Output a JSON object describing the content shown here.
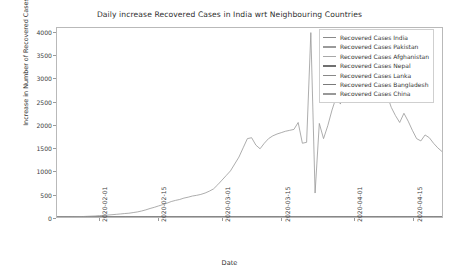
{
  "chart_data": {
    "type": "line",
    "title": "Daily increase Recovered Cases in India wrt Neighbouring Countries",
    "xlabel": "Date",
    "ylabel": "Increase in Number of Recovered Cases",
    "grid": false,
    "legend_position": "upper right",
    "ylim": [
      0,
      4100
    ],
    "yticks": [
      0,
      500,
      1000,
      1500,
      2000,
      2500,
      3000,
      3500,
      4000
    ],
    "ytick_labels": [
      "0",
      "500",
      "1000",
      "1500",
      "2000",
      "2500",
      "3000",
      "3500",
      "4000"
    ],
    "xlim": [
      "2020-01-22",
      "2020-04-22"
    ],
    "xticks": [
      "2020-02-01",
      "2020-02-15",
      "2020-03-01",
      "2020-03-15",
      "2020-04-01",
      "2020-04-15"
    ],
    "xtick_labels": [
      "2020-02-01",
      "2020-02-15",
      "2020-03-01",
      "2020-03-15",
      "2020-04-01",
      "2020-04-15"
    ],
    "colors": {
      "india": "#8a8a8a",
      "pakistan": "#9a9a9a",
      "afghanistan": "#a8a8a8",
      "nepal": "#707070",
      "lanka": "#888888",
      "bangladesh": "#7a7a7a",
      "china": "#989898"
    },
    "series": [
      {
        "name": "Recovered Cases India",
        "color": "#8a8a8a",
        "values": [
          0,
          0,
          0,
          0,
          0,
          0,
          0,
          0,
          0,
          0,
          0,
          0,
          0,
          0,
          0,
          0,
          0,
          0,
          0,
          0,
          0,
          0,
          0,
          0,
          0,
          0,
          0,
          0,
          0,
          0,
          0,
          0,
          0,
          0,
          0,
          0,
          0,
          0,
          0,
          0,
          0,
          0,
          0,
          0,
          0,
          0,
          0,
          0,
          0,
          0,
          0,
          0,
          0,
          0,
          0,
          0,
          0,
          0,
          0,
          0,
          0,
          0,
          0,
          0,
          0,
          0,
          0,
          0,
          0,
          0,
          0,
          0,
          0,
          0,
          0,
          0,
          0,
          0,
          0,
          0,
          0,
          0,
          0,
          0,
          0,
          0,
          0,
          0,
          0,
          0,
          0
        ]
      },
      {
        "name": "Recovered Cases Pakistan",
        "color": "#9a9a9a",
        "values": [
          0,
          0,
          0,
          0,
          0,
          0,
          0,
          0,
          0,
          0,
          0,
          0,
          0,
          0,
          0,
          0,
          0,
          0,
          0,
          0,
          0,
          0,
          0,
          0,
          0,
          0,
          0,
          0,
          0,
          0,
          0,
          0,
          0,
          0,
          0,
          0,
          0,
          0,
          0,
          0,
          0,
          0,
          0,
          0,
          0,
          0,
          0,
          0,
          0,
          0,
          0,
          0,
          0,
          0,
          0,
          0,
          0,
          0,
          0,
          0,
          0,
          0,
          0,
          0,
          0,
          0,
          0,
          0,
          0,
          0,
          0,
          0,
          0,
          0,
          0,
          0,
          0,
          0,
          0,
          0,
          0,
          0,
          0,
          0,
          0,
          0,
          0,
          0,
          0,
          0,
          0
        ]
      },
      {
        "name": "Recovered Cases Afghanistan",
        "color": "#a8a8a8",
        "values": [
          0,
          0,
          0,
          0,
          0,
          0,
          0,
          0,
          0,
          0,
          0,
          0,
          0,
          0,
          0,
          0,
          0,
          0,
          0,
          0,
          0,
          0,
          0,
          0,
          0,
          0,
          0,
          0,
          0,
          0,
          0,
          0,
          0,
          0,
          0,
          0,
          0,
          0,
          0,
          0,
          0,
          0,
          0,
          0,
          0,
          0,
          0,
          0,
          0,
          0,
          0,
          0,
          0,
          0,
          0,
          0,
          0,
          0,
          0,
          0,
          0,
          0,
          0,
          0,
          0,
          0,
          0,
          0,
          0,
          0,
          0,
          0,
          0,
          0,
          0,
          0,
          0,
          0,
          0,
          0,
          0,
          0,
          0,
          0,
          0,
          0,
          0,
          0,
          0,
          0,
          0
        ]
      },
      {
        "name": "Recovered Cases Nepal",
        "color": "#707070",
        "values": [
          0,
          0,
          0,
          0,
          0,
          0,
          0,
          0,
          0,
          0,
          0,
          0,
          0,
          0,
          0,
          0,
          0,
          0,
          0,
          0,
          0,
          0,
          0,
          0,
          0,
          0,
          0,
          0,
          0,
          0,
          0,
          0,
          0,
          0,
          0,
          0,
          0,
          0,
          0,
          0,
          0,
          0,
          0,
          0,
          0,
          0,
          0,
          0,
          0,
          0,
          0,
          0,
          0,
          0,
          0,
          0,
          0,
          0,
          0,
          0,
          0,
          0,
          0,
          0,
          0,
          0,
          0,
          0,
          0,
          0,
          0,
          0,
          0,
          0,
          0,
          0,
          0,
          0,
          0,
          0,
          0,
          0,
          0,
          0,
          0,
          0,
          0,
          0,
          0,
          0,
          0
        ]
      },
      {
        "name": "Recovered Cases Lanka",
        "color": "#888888",
        "values": [
          0,
          0,
          0,
          0,
          0,
          0,
          0,
          0,
          0,
          0,
          0,
          0,
          0,
          0,
          0,
          0,
          0,
          0,
          0,
          0,
          0,
          0,
          0,
          0,
          0,
          0,
          0,
          0,
          0,
          0,
          0,
          0,
          0,
          0,
          0,
          0,
          0,
          0,
          0,
          0,
          0,
          0,
          0,
          0,
          0,
          0,
          0,
          0,
          0,
          0,
          0,
          0,
          0,
          0,
          0,
          0,
          0,
          0,
          0,
          0,
          0,
          0,
          0,
          0,
          0,
          0,
          0,
          0,
          0,
          0,
          0,
          0,
          0,
          0,
          0,
          0,
          0,
          0,
          0,
          0,
          0,
          0,
          0,
          0,
          0,
          0,
          0,
          0,
          0,
          0,
          0
        ]
      },
      {
        "name": "Recovered Cases Bangladesh",
        "color": "#7a7a7a",
        "values": [
          0,
          0,
          0,
          0,
          0,
          0,
          0,
          0,
          0,
          0,
          0,
          0,
          0,
          0,
          0,
          0,
          0,
          0,
          0,
          0,
          0,
          0,
          0,
          0,
          0,
          0,
          0,
          0,
          0,
          0,
          0,
          0,
          0,
          0,
          0,
          0,
          0,
          0,
          0,
          0,
          0,
          0,
          0,
          0,
          0,
          0,
          0,
          0,
          0,
          0,
          0,
          0,
          0,
          0,
          0,
          0,
          0,
          0,
          0,
          0,
          0,
          0,
          0,
          0,
          0,
          0,
          0,
          0,
          0,
          0,
          0,
          0,
          0,
          0,
          0,
          0,
          0,
          0,
          0,
          0,
          0,
          0,
          0,
          0,
          0,
          0,
          0,
          0,
          0,
          0,
          0
        ]
      },
      {
        "name": "Recovered Cases China",
        "color": "#989898",
        "values": [
          0,
          0,
          0,
          3,
          5,
          8,
          10,
          14,
          18,
          22,
          30,
          36,
          42,
          50,
          58,
          66,
          75,
          82,
          96,
          110,
          130,
          155,
          185,
          210,
          240,
          268,
          300,
          335,
          360,
          380,
          410,
          430,
          455,
          470,
          490,
          520,
          560,
          610,
          700,
          800,
          900,
          1000,
          1150,
          1300,
          1500,
          1700,
          1720,
          1560,
          1480,
          1600,
          1700,
          1760,
          1800,
          1830,
          1860,
          1880,
          1900,
          2050,
          1600,
          1620,
          4000,
          520,
          2030,
          1700,
          1980,
          2320,
          2600,
          2450,
          3150,
          2900,
          3350,
          3480,
          3380,
          3280,
          3180,
          2950,
          2880,
          2800,
          2650,
          2380,
          2200,
          2050,
          2250,
          2080,
          1880,
          1700,
          1650,
          1780,
          1720,
          1600,
          1500,
          1420
        ]
      }
    ]
  },
  "axes": {
    "ylabel": "Increase in Number of Recovered Cases",
    "xlabel": "Date"
  },
  "legend": {
    "items": [
      {
        "label": "Recovered Cases India",
        "color": "#8a8a8a"
      },
      {
        "label": "Recovered Cases Pakistan",
        "color": "#9a9a9a"
      },
      {
        "label": "Recovered Cases Afghanistan",
        "color": "#a8a8a8"
      },
      {
        "label": "Recovered Cases Nepal",
        "color": "#707070"
      },
      {
        "label": "Recovered Cases Lanka",
        "color": "#888888"
      },
      {
        "label": "Recovered Cases Bangladesh",
        "color": "#7a7a7a"
      },
      {
        "label": "Recovered Cases China",
        "color": "#989898"
      }
    ]
  }
}
